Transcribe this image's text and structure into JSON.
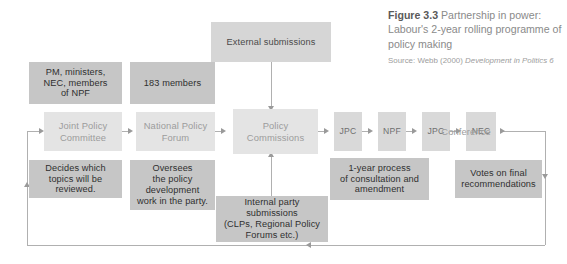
{
  "figure": {
    "number_label": "Figure 3.3",
    "caption": "Partnership in power: Labour's 2-year rolling programme of policy making",
    "source_prefix": "Source: Webb (2000) ",
    "source_title": "Development in Politics 6"
  },
  "colors": {
    "box_dark": "#c6c6c6",
    "box_light": "#e4e4e4",
    "box_mid": "#d6d6d6",
    "box_small": "#d9d9d9",
    "connector": "#b0b0b0",
    "background": "#ffffff"
  },
  "nodes": {
    "external_submissions": "External submissions",
    "internal_submissions": "Internal party\nsubmissions\n(CLPs, Regional Policy\nForums etc.)",
    "membership_jpc": "PM, ministers,\nNEC, members\nof NPF",
    "membership_npf": "183 members",
    "joint_policy_committee": "Joint Policy\nCommittee",
    "national_policy_forum": "National Policy\nForum",
    "policy_commissions": "Policy\nCommissions",
    "stage_jpc_1": "JPC",
    "stage_npf": "NPF",
    "stage_jpc_2": "JPC",
    "stage_nec": "NEC",
    "conference": "Conference",
    "note_jpc": "Decides which\ntopics will be\nreviewed.",
    "note_npf": "Oversees\nthe policy\ndevelopment\nwork in the party.",
    "note_process": "1-year process\nof consultation and\namendment",
    "note_conference": "Votes on final\nrecommendations"
  }
}
